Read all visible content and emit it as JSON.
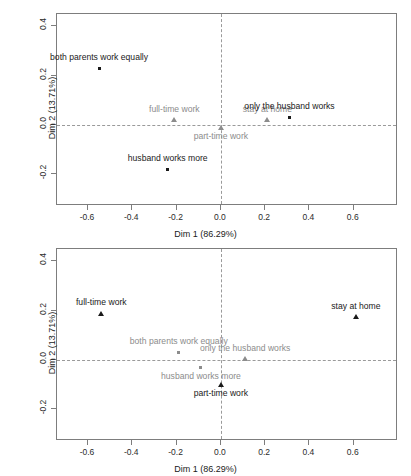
{
  "chart_data": [
    {
      "id": "top",
      "type": "scatter",
      "title": "",
      "xlabel": "Dim 1 (86.29%)",
      "ylabel": "Dim 2 (13.71%)",
      "xlim": [
        -0.74,
        0.8
      ],
      "ylim": [
        -0.33,
        0.45
      ],
      "xticks": [
        -0.6,
        -0.4,
        -0.2,
        0.0,
        0.2,
        0.4,
        0.6
      ],
      "xticklabels": [
        "-0.6",
        "-0.4",
        "-0.2",
        "0.0",
        "0.2",
        "0.4",
        "0.6"
      ],
      "yticks": [
        -0.2,
        0.0,
        0.2,
        0.4
      ],
      "yticklabels": [
        "-0.2",
        "0.0",
        "0.2",
        "0.4"
      ],
      "grid": false,
      "zero_lines": true,
      "legend": "none",
      "points": [
        {
          "label": "both parents work equally",
          "x": -0.55,
          "y": 0.23,
          "marker": "square",
          "color": "#1a1a1a",
          "label_pos": "above",
          "label_dx": 0
        },
        {
          "label": "full-time work",
          "x": -0.21,
          "y": 0.02,
          "marker": "triangle",
          "color": "#8c8c8c",
          "label_pos": "above",
          "label_dx": 0
        },
        {
          "label": "part-time work",
          "x": 0.0,
          "y": -0.01,
          "marker": "triangle",
          "color": "#8c8c8c",
          "label_pos": "below",
          "label_dx": 0
        },
        {
          "label": "stay at home",
          "x": 0.21,
          "y": 0.02,
          "marker": "triangle",
          "color": "#8c8c8c",
          "label_pos": "above",
          "label_dx": 0
        },
        {
          "label": "only the husband works",
          "x": 0.31,
          "y": 0.03,
          "marker": "square",
          "color": "#1a1a1a",
          "label_pos": "above",
          "label_dx": 0
        },
        {
          "label": "husband works more",
          "x": -0.24,
          "y": -0.18,
          "marker": "square",
          "color": "#1a1a1a",
          "label_pos": "above",
          "label_dx": 0
        }
      ]
    },
    {
      "id": "bottom",
      "type": "scatter",
      "title": "",
      "xlabel": "Dim 1 (86.29%)",
      "ylabel": "Dim 2 (13.71%)",
      "xlim": [
        -0.74,
        0.8
      ],
      "ylim": [
        -0.33,
        0.45
      ],
      "xticks": [
        -0.6,
        -0.4,
        -0.2,
        0.0,
        0.2,
        0.4,
        0.6
      ],
      "xticklabels": [
        "-0.6",
        "-0.4",
        "-0.2",
        "0.0",
        "0.2",
        "0.4",
        "0.6"
      ],
      "yticks": [
        -0.2,
        0.0,
        0.2,
        0.4
      ],
      "yticklabels": [
        "-0.2",
        "0.0",
        "0.2",
        "0.4"
      ],
      "grid": false,
      "zero_lines": true,
      "legend": "none",
      "points": [
        {
          "label": "full-time work",
          "x": -0.54,
          "y": 0.19,
          "marker": "triangle",
          "color": "#1a1a1a",
          "label_pos": "above",
          "label_dx": 0
        },
        {
          "label": "stay at home",
          "x": 0.61,
          "y": 0.175,
          "marker": "triangle",
          "color": "#1a1a1a",
          "label_pos": "above",
          "label_dx": 0
        },
        {
          "label": "both parents work equally",
          "x": -0.19,
          "y": 0.03,
          "marker": "square",
          "color": "#8c8c8c",
          "label_pos": "above",
          "label_dx": 0
        },
        {
          "label": "only the husband works",
          "x": 0.11,
          "y": 0.005,
          "marker": "triangle",
          "color": "#8c8c8c",
          "label_pos": "above",
          "label_dx": 0
        },
        {
          "label": "husband works more",
          "x": -0.09,
          "y": -0.03,
          "marker": "square",
          "color": "#8c8c8c",
          "label_pos": "below",
          "label_dx": 0
        },
        {
          "label": "part-time work",
          "x": 0.0,
          "y": -0.1,
          "marker": "triangle",
          "color": "#1a1a1a",
          "label_pos": "below",
          "label_dx": 0
        }
      ]
    }
  ],
  "figures": [
    {
      "name": "correspondence-analysis-plot-1"
    },
    {
      "name": "correspondence-analysis-plot-2"
    }
  ],
  "colors": {
    "axis": "#7d7d7d",
    "zero_line": "#9a9a9a",
    "text_dark": "#1a1a1a",
    "text_gray": "#8c8c8c",
    "background": "#ffffff"
  }
}
